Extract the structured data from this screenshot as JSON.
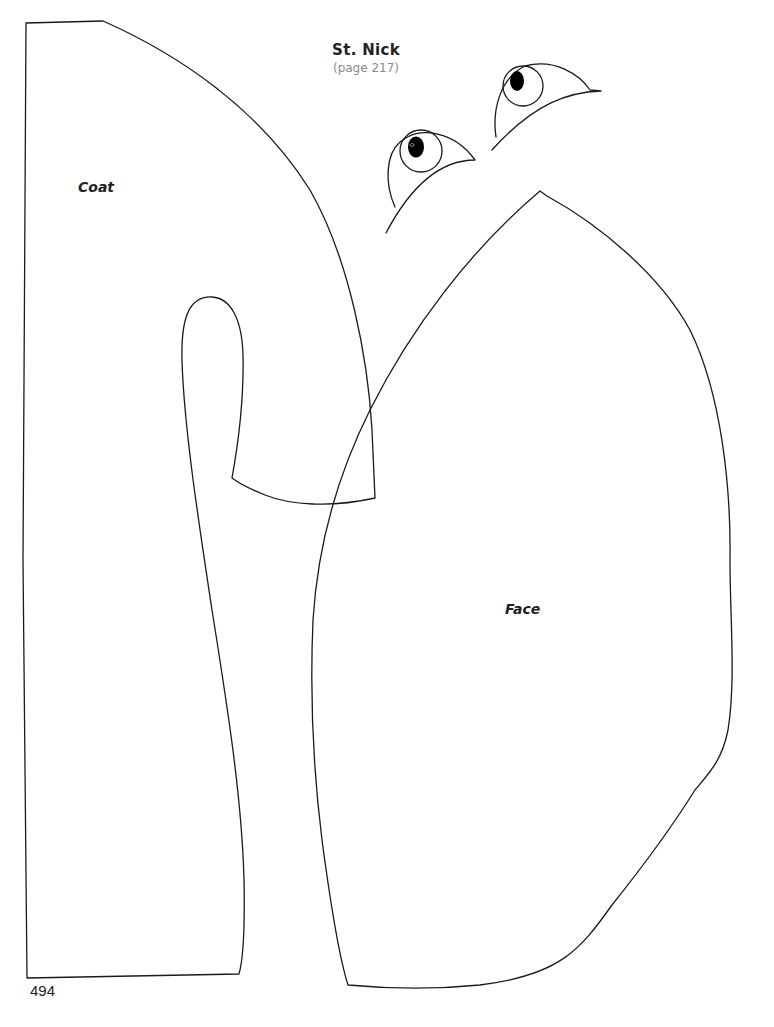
{
  "page": {
    "title": "St. Nick",
    "subtitle": "(page 217)",
    "page_number": "494"
  },
  "pattern_pieces": [
    {
      "id": "coat",
      "label": "Coat"
    },
    {
      "id": "face",
      "label": "Face"
    },
    {
      "id": "eye-left",
      "label": ""
    },
    {
      "id": "eye-right",
      "label": ""
    }
  ],
  "colors": {
    "background": "#ffffff",
    "outline": "#1a1a1a",
    "subtitle": "#8a8a8a",
    "pupil": "#000000"
  }
}
